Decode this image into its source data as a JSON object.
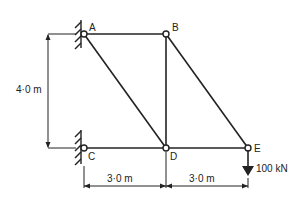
{
  "diagram": {
    "type": "pin-jointed truss",
    "nodes": [
      {
        "id": "A",
        "label": "A",
        "x": 84,
        "y": 34,
        "support": "wall-pin"
      },
      {
        "id": "B",
        "label": "B",
        "x": 166,
        "y": 34
      },
      {
        "id": "C",
        "label": "C",
        "x": 84,
        "y": 148,
        "support": "wall-pin"
      },
      {
        "id": "D",
        "label": "D",
        "x": 166,
        "y": 148
      },
      {
        "id": "E",
        "label": "E",
        "x": 248,
        "y": 148
      }
    ],
    "members": [
      [
        "A",
        "B"
      ],
      [
        "A",
        "D"
      ],
      [
        "B",
        "D"
      ],
      [
        "B",
        "E"
      ],
      [
        "C",
        "D"
      ],
      [
        "D",
        "E"
      ]
    ],
    "load": {
      "node": "E",
      "label": "100 kN",
      "direction": "down"
    },
    "dimensions": {
      "height": "4·0 m",
      "span_cd": "3·0 m",
      "span_de": "3·0 m"
    },
    "line_color": "#222222"
  }
}
